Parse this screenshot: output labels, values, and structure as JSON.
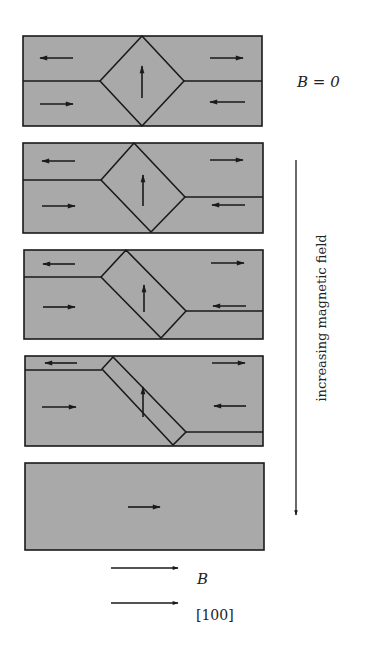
{
  "colors": {
    "domain_fill": "#a9a9a9",
    "line": "#1a1a1a",
    "background": "#ffffff"
  },
  "labels": {
    "zero_field": "B = 0",
    "axis": "increasing magnetic field",
    "legend_B": "B",
    "legend_dir": "[100]"
  },
  "panels": [
    {
      "name": "panel-1-zero-field",
      "rect": [
        23,
        36,
        239,
        90
      ],
      "walls": [
        [
          23,
          81,
          100,
          81
        ],
        [
          184,
          81,
          262,
          81
        ]
      ],
      "closure": [
        [
          142,
          36
        ],
        [
          184,
          81
        ],
        [
          142,
          126
        ],
        [
          100,
          81
        ]
      ],
      "arrows": [
        {
          "x1": 73,
          "y1": 58,
          "x2": 40,
          "y2": 58,
          "dir": "left"
        },
        {
          "x1": 210,
          "y1": 58,
          "x2": 243,
          "y2": 58,
          "dir": "right"
        },
        {
          "x1": 40,
          "y1": 104,
          "x2": 73,
          "y2": 104,
          "dir": "right"
        },
        {
          "x1": 245,
          "y1": 102,
          "x2": 210,
          "y2": 102,
          "dir": "left"
        },
        {
          "x1": 142,
          "y1": 98,
          "x2": 142,
          "y2": 66,
          "dir": "up"
        }
      ]
    },
    {
      "name": "panel-2",
      "rect": [
        23,
        143,
        240,
        90
      ],
      "walls": [
        [
          23,
          180,
          101,
          180
        ],
        [
          185,
          197,
          263,
          197
        ]
      ],
      "closure": [
        [
          134,
          143
        ],
        [
          185,
          197
        ],
        [
          151,
          232
        ],
        [
          101,
          180
        ]
      ],
      "arrows": [
        {
          "x1": 75,
          "y1": 161,
          "x2": 42,
          "y2": 161,
          "dir": "left"
        },
        {
          "x1": 210,
          "y1": 160,
          "x2": 243,
          "y2": 160,
          "dir": "right"
        },
        {
          "x1": 42,
          "y1": 206,
          "x2": 75,
          "y2": 206,
          "dir": "right"
        },
        {
          "x1": 245,
          "y1": 205,
          "x2": 212,
          "y2": 205,
          "dir": "left"
        },
        {
          "x1": 143,
          "y1": 206,
          "x2": 143,
          "y2": 175,
          "dir": "up"
        }
      ]
    },
    {
      "name": "panel-3",
      "rect": [
        24,
        250,
        239,
        89
      ],
      "walls": [
        [
          24,
          277,
          101,
          277
        ],
        [
          186,
          311,
          263,
          311
        ]
      ],
      "closure": [
        [
          126,
          250
        ],
        [
          186,
          311
        ],
        [
          161,
          338
        ],
        [
          101,
          277
        ]
      ],
      "arrows": [
        {
          "x1": 75,
          "y1": 264,
          "x2": 43,
          "y2": 264,
          "dir": "left"
        },
        {
          "x1": 211,
          "y1": 263,
          "x2": 244,
          "y2": 263,
          "dir": "right"
        },
        {
          "x1": 43,
          "y1": 307,
          "x2": 75,
          "y2": 307,
          "dir": "right"
        },
        {
          "x1": 246,
          "y1": 306,
          "x2": 213,
          "y2": 306,
          "dir": "left"
        },
        {
          "x1": 144,
          "y1": 312,
          "x2": 144,
          "y2": 285,
          "dir": "up"
        }
      ]
    },
    {
      "name": "panel-4",
      "rect": [
        25,
        356,
        238,
        90
      ],
      "walls": [
        [
          25,
          370,
          102,
          370
        ],
        [
          186,
          432,
          263,
          432
        ]
      ],
      "closure": [
        [
          113,
          357
        ],
        [
          186,
          432
        ],
        [
          173,
          445
        ],
        [
          102,
          369
        ]
      ],
      "arrows": [
        {
          "x1": 77,
          "y1": 363,
          "x2": 45,
          "y2": 363,
          "dir": "left"
        },
        {
          "x1": 212,
          "y1": 363,
          "x2": 245,
          "y2": 363,
          "dir": "right"
        },
        {
          "x1": 42,
          "y1": 407,
          "x2": 76,
          "y2": 407,
          "dir": "right"
        },
        {
          "x1": 246,
          "y1": 406,
          "x2": 214,
          "y2": 406,
          "dir": "left"
        },
        {
          "x1": 143,
          "y1": 417,
          "x2": 143,
          "y2": 387,
          "dir": "up"
        }
      ]
    },
    {
      "name": "panel-5-saturated",
      "rect": [
        25,
        463,
        239,
        87
      ],
      "walls": [],
      "closure": [],
      "arrows": [
        {
          "x1": 128,
          "y1": 507,
          "x2": 160,
          "y2": 507,
          "dir": "right"
        }
      ]
    }
  ],
  "field_arrow": {
    "x": 296,
    "y1": 160,
    "y2": 515
  },
  "legend": [
    {
      "x1": 111,
      "y1": 568,
      "x2": 178,
      "label_x": 197,
      "label_y": 584
    },
    {
      "x1": 111,
      "y1": 603,
      "x2": 178,
      "label_x": 196,
      "label_y": 620
    }
  ]
}
